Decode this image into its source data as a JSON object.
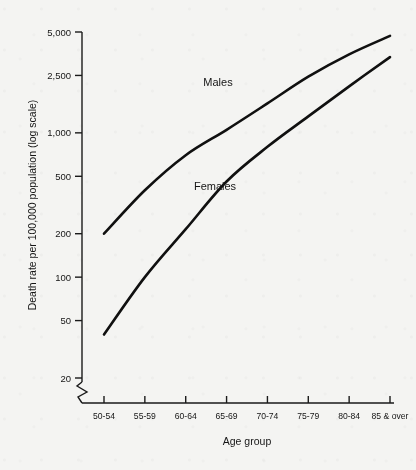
{
  "chart_data": {
    "type": "line",
    "title": "",
    "subtitle": "",
    "xlabel": "Age group",
    "ylabel": "Death rate per 100,000 population (log scale)",
    "y_scale": "log",
    "ylim": [
      20,
      5000
    ],
    "grid": false,
    "legend_position": "inline-annotations",
    "categories": [
      "50-54",
      "55-59",
      "60-64",
      "65-69",
      "70-74",
      "75-79",
      "80-84",
      "85 & over"
    ],
    "y_ticks": [
      {
        "value": 5000,
        "label": "5,000"
      },
      {
        "value": 2500,
        "label": "2,500"
      },
      {
        "value": 1000,
        "label": "1,000"
      },
      {
        "value": 500,
        "label": "500"
      },
      {
        "value": 200,
        "label": "200"
      },
      {
        "value": 100,
        "label": "100"
      },
      {
        "value": 50,
        "label": "50"
      },
      {
        "value": 20,
        "label": "20"
      }
    ],
    "axis_break": {
      "present": true,
      "axis": "y",
      "below_value": 20
    },
    "series": [
      {
        "name": "Males",
        "label": "Males",
        "color": "#101010",
        "values": [
          200,
          400,
          700,
          1050,
          1600,
          2450,
          3500,
          4700
        ]
      },
      {
        "name": "Females",
        "label": "Females",
        "color": "#101010",
        "values": [
          40,
          100,
          215,
          460,
          800,
          1300,
          2100,
          3350
        ]
      }
    ],
    "annotations": [
      {
        "name": "males-label",
        "text": "Males",
        "x_px": 218,
        "y_px": 86
      },
      {
        "name": "females-label",
        "text": "Females",
        "x_px": 215,
        "y_px": 190
      }
    ]
  },
  "figure": {
    "background_color": "#f4f4f2",
    "ink_color": "#101010"
  }
}
